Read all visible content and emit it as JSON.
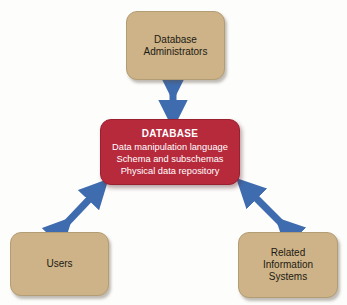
{
  "diagram": {
    "colors": {
      "node_fill": "#cdb387",
      "database_fill": "#b62a3c",
      "arrow": "#3f6cae",
      "background": "#fdfdfc",
      "node_text": "#1d1a14",
      "database_text": "#ffffff"
    },
    "nodes": {
      "dba": {
        "label": "Database\nAdministrators"
      },
      "database": {
        "title": "DATABASE",
        "lines": "Data manipulation language\nSchema and subschemas\nPhysical data repository"
      },
      "users": {
        "label": "Users"
      },
      "related": {
        "label": "Related\nInformation\nSystems"
      }
    },
    "connectors": [
      {
        "name": "dba-database",
        "from": "dba",
        "to": "database",
        "style": "double-headed"
      },
      {
        "name": "users-database",
        "from": "users",
        "to": "database",
        "style": "double-headed"
      },
      {
        "name": "related-database",
        "from": "related",
        "to": "database",
        "style": "double-headed"
      }
    ]
  }
}
